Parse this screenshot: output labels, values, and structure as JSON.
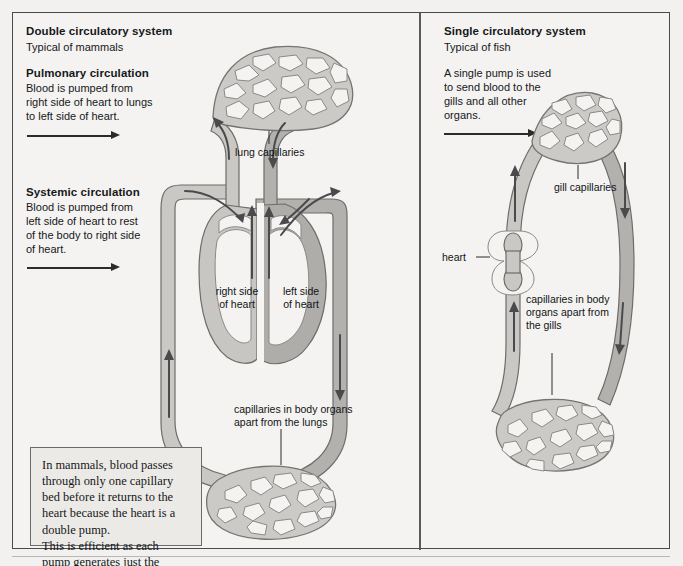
{
  "figure": {
    "background_color": "#f4f3f1",
    "frame_color": "#4a4a4a",
    "vessel_color": "#c9c8c5",
    "vessel_dark_color": "#b2b1ae",
    "arrow_color": "#4a4a4c"
  },
  "left_panel": {
    "title": "Double circulatory system",
    "subtitle": "Typical of mammals",
    "pulmonary": {
      "heading": "Pulmonary circulation",
      "body": "Blood is pumped from\nright side of heart to lungs\nto left side of heart.",
      "arrow_icon": "right-arrow-icon"
    },
    "systemic": {
      "heading": "Systemic circulation",
      "body": "Blood is pumped from\nleft side of heart to rest\nof the body to right side\nof heart.",
      "arrow_icon": "right-arrow-icon"
    },
    "diagram_labels": {
      "lung_capillaries": "lung capillaries",
      "right_side_of_heart": "right side\nof heart",
      "left_side_of_heart": "left side\nof heart",
      "body_capillaries": "capillaries in body organs\napart from the lungs"
    },
    "note": "In mammals, blood passes\nthrough only one capillary\nbed before it returns to the\nheart because the heart is a\ndouble pump.\nThis is efficient as each\npump generates just the\nforce needed for each\ncapillary bed."
  },
  "right_panel": {
    "title": "Single circulatory system",
    "subtitle": "Typical of fish",
    "intro": {
      "body": "A single pump is used\nto send blood to the\ngills and all other\norgans.",
      "arrow_icon": "right-arrow-icon"
    },
    "diagram_labels": {
      "gill_capillaries": "gill capillaries",
      "heart": "heart",
      "body_capillaries": "capillaries in body\norgans apart from\nthe gills"
    },
    "note": "In the circulatory system of fish the\nheart has to generate sufficient pressure\nto overcome the resistance of gill\ncapillaries and then the resistance of\ncapillaries in other body organs before\nthe blood returns to the heart."
  }
}
